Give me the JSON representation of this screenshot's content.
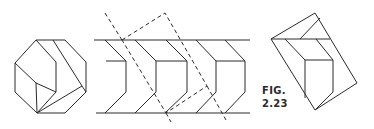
{
  "figure": {
    "label_line1": "FIG.",
    "label_line2": "2.23"
  },
  "colors": {
    "stroke": "#2a2a2a",
    "background": "#ffffff"
  },
  "panels": [
    {
      "name": "octagonal-end-view",
      "description": "Octagon outline with inscribed hexagonal prism and fan lines"
    },
    {
      "name": "strip-pattern-view",
      "description": "Horizontal strip between two parallel lines with repeating chevron/hexagonal prism shapes and a dashed rotated rectangle"
    },
    {
      "name": "rotated-quadrilateral-view",
      "description": "Tilted quadrilateral containing a cube-like prism"
    }
  ]
}
